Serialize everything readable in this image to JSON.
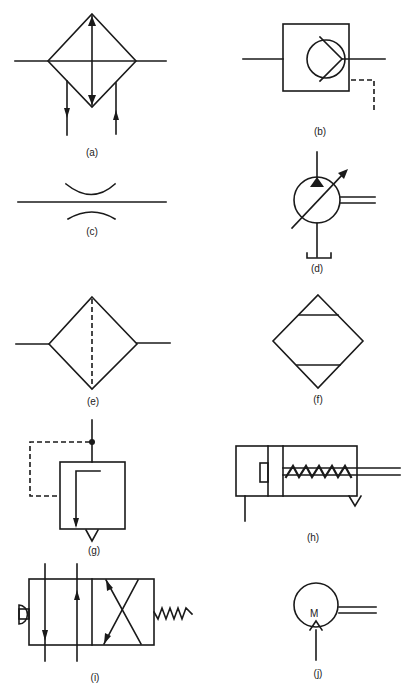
{
  "figure": {
    "symbols": [
      {
        "id": "a",
        "label": "(a)",
        "description": "heat exchanger / cooler with coolant flow"
      },
      {
        "id": "b",
        "label": "(b)",
        "description": "hydraulic motor in enclosure with drain line"
      },
      {
        "id": "c",
        "label": "(c)",
        "description": "restrictor / throttle"
      },
      {
        "id": "d",
        "label": "(d)",
        "description": "variable displacement pump with drive shaft and tank"
      },
      {
        "id": "e",
        "label": "(e)",
        "description": "filter / strainer"
      },
      {
        "id": "f",
        "label": "(f)",
        "description": "water trap / separator"
      },
      {
        "id": "g",
        "label": "(g)",
        "description": "pressure relief valve with pilot line"
      },
      {
        "id": "h",
        "label": "(h)",
        "description": "single-acting spring return cylinder"
      },
      {
        "id": "i",
        "label": "(i)",
        "description": "4/2 directional valve, push-button with spring return"
      },
      {
        "id": "j",
        "label": "(j)",
        "description": "electric motor driven shaft",
        "inner_text": "M"
      }
    ]
  }
}
